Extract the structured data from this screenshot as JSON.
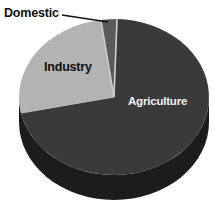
{
  "chart_data": {
    "type": "pie",
    "title": "",
    "subtitle": "",
    "xlabel": "",
    "ylabel": "",
    "legend_position": "none",
    "grid": false,
    "three_d": true,
    "categories": [
      "Agriculture",
      "Industry",
      "Domestic"
    ],
    "values": [
      62,
      32,
      6
    ],
    "unit": "percent",
    "slices": [
      {
        "label": "Agriculture",
        "value": 62,
        "color": "#3a3a3a",
        "label_color": "#f2f2f2",
        "label_placement": "inside",
        "start_angle_deg": 2,
        "end_angle_deg": 225
      },
      {
        "label": "Industry",
        "value": 32,
        "color": "#b3b3b3",
        "label_color": "#101010",
        "label_placement": "inside",
        "start_angle_deg": 225,
        "end_angle_deg": 340
      },
      {
        "label": "Domestic",
        "value": 6,
        "color": "#5a5a5a",
        "label_color": "#101010",
        "label_placement": "outside-leader",
        "start_angle_deg": 340,
        "end_angle_deg": 362
      }
    ],
    "colors": {
      "agriculture_slice": "#3a3a3a",
      "industry_slice": "#b3b3b3",
      "domestic_slice": "#5a5a5a",
      "pie_side_depth": "#1c1c1c",
      "separator_line": "#cfcfcf",
      "leader_line": "#101010",
      "background": "#ffffff"
    },
    "annotations": [
      {
        "name": "domestic-leader-line",
        "text": "Domestic",
        "from_x": 62,
        "from_y": 15,
        "to_x": 108,
        "to_y": 22
      }
    ]
  },
  "labels": {
    "agriculture": "Agriculture",
    "industry": "Industry",
    "domestic": "Domestic"
  }
}
